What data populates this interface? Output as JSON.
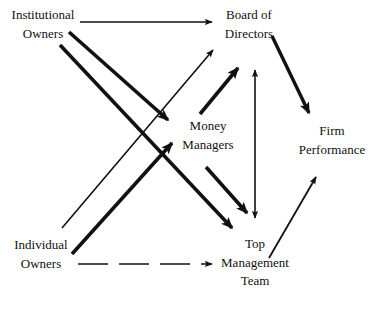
{
  "diagram": {
    "background_color": "#ffffff",
    "ink_color": "#111111",
    "nodes": [
      {
        "id": "institutional-owners",
        "lines": [
          "Institutional",
          "Owners"
        ],
        "line1": "Institutional",
        "line2": "Owners"
      },
      {
        "id": "board-of-directors",
        "lines": [
          "Board of",
          "Directors"
        ],
        "line1": "Board of",
        "line2": "Directors"
      },
      {
        "id": "money-managers",
        "lines": [
          "Money",
          "Managers"
        ],
        "line1": "Money",
        "line2": "Managers"
      },
      {
        "id": "firm-performance",
        "lines": [
          "Firm",
          "Performance"
        ],
        "line1": "Firm",
        "line2": "Performance"
      },
      {
        "id": "individual-owners",
        "lines": [
          "Individual",
          "Owners"
        ],
        "line1": "Individual",
        "line2": "Owners"
      },
      {
        "id": "top-management-team",
        "lines": [
          "Top",
          "Management",
          "Team"
        ],
        "line1": "Top",
        "line2": "Management",
        "line3": "Team"
      }
    ],
    "edges": [
      {
        "id": "institutional-owners-to-board-of-directors",
        "from": "institutional-owners",
        "to": "board-of-directors",
        "style": "solid",
        "weight": "thin",
        "heads": "single"
      },
      {
        "id": "institutional-owners-to-money-managers",
        "from": "institutional-owners",
        "to": "money-managers",
        "style": "solid",
        "weight": "thick",
        "heads": "single"
      },
      {
        "id": "institutional-owners-to-top-management-team",
        "from": "institutional-owners",
        "to": "top-management-team",
        "style": "solid",
        "weight": "thick",
        "heads": "single"
      },
      {
        "id": "individual-owners-to-board-of-directors",
        "from": "individual-owners",
        "to": "board-of-directors",
        "style": "solid",
        "weight": "thin",
        "heads": "single"
      },
      {
        "id": "individual-owners-to-money-managers",
        "from": "individual-owners",
        "to": "money-managers",
        "style": "solid",
        "weight": "thick",
        "heads": "single"
      },
      {
        "id": "individual-owners-to-top-management-team",
        "from": "individual-owners",
        "to": "top-management-team",
        "style": "dashed",
        "weight": "thin",
        "heads": "single"
      },
      {
        "id": "money-managers-to-board-of-directors",
        "from": "money-managers",
        "to": "board-of-directors",
        "style": "solid",
        "weight": "thick",
        "heads": "single"
      },
      {
        "id": "money-managers-to-top-management-team",
        "from": "money-managers",
        "to": "top-management-team",
        "style": "solid",
        "weight": "thick",
        "heads": "single"
      },
      {
        "id": "board-of-directors-to-top-management-team",
        "from": "board-of-directors",
        "to": "top-management-team",
        "style": "solid",
        "weight": "thin",
        "heads": "double"
      },
      {
        "id": "board-of-directors-to-firm-performance",
        "from": "board-of-directors",
        "to": "firm-performance",
        "style": "solid",
        "weight": "thick",
        "heads": "single"
      },
      {
        "id": "top-management-team-to-firm-performance",
        "from": "top-management-team",
        "to": "firm-performance",
        "style": "solid",
        "weight": "thin",
        "heads": "single"
      }
    ]
  }
}
